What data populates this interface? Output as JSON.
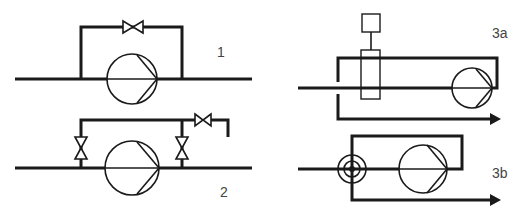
{
  "diagram": {
    "colors": {
      "line": "#1a1a1a",
      "label": "#444444",
      "background": "#ffffff"
    },
    "panels": [
      {
        "id": "1",
        "label": "1",
        "description": "Pump with bypass line containing one shut-off valve"
      },
      {
        "id": "2",
        "label": "2",
        "description": "Pump with bypass via two shut-off valves and a vented outlet valve"
      },
      {
        "id": "3a",
        "label": "3a",
        "description": "Circulation loop with actuated mixing/injection unit on the inlet"
      },
      {
        "id": "3b",
        "label": "3b",
        "description": "Circulation loop with concentric coupling (double-pipe) on the inlet"
      }
    ]
  }
}
